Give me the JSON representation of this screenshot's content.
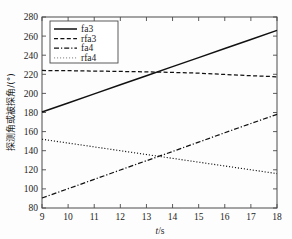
{
  "chart_data": {
    "type": "line",
    "title": "",
    "xlabel": "t/s",
    "ylabel": "探测角或被探角/(°)",
    "xlim": [
      9,
      18
    ],
    "ylim": [
      80,
      280
    ],
    "xticks": [
      9,
      10,
      11,
      12,
      13,
      14,
      15,
      16,
      17,
      18
    ],
    "yticks": [
      80,
      100,
      120,
      140,
      160,
      180,
      200,
      220,
      240,
      260,
      280
    ],
    "xtick_labels": [
      "9",
      "10",
      "11",
      "12",
      "13",
      "14",
      "15",
      "16",
      "17",
      "18"
    ],
    "ytick_labels": [
      "80",
      "100",
      "120",
      "140",
      "160",
      "180",
      "200",
      "220",
      "240",
      "260",
      "280"
    ],
    "grid": false,
    "legend_position": "upper-left",
    "x": [
      9,
      10,
      11,
      12,
      13,
      14,
      15,
      16,
      17,
      18
    ],
    "series": [
      {
        "name": "fa3",
        "style": "solid",
        "color": "#111111",
        "values": [
          180.5,
          190.0,
          199.5,
          209.0,
          218.5,
          228.0,
          237.5,
          247.0,
          256.5,
          266.0
        ]
      },
      {
        "name": "rfa3",
        "style": "dashed",
        "color": "#111111",
        "values": [
          224.0,
          223.8,
          223.4,
          223.0,
          222.6,
          222.0,
          221.2,
          219.8,
          218.5,
          217.4
        ]
      },
      {
        "name": "fa4",
        "style": "dashdot",
        "color": "#111111",
        "values": [
          90.5,
          100.2,
          110.0,
          119.8,
          129.5,
          139.2,
          149.0,
          158.8,
          168.5,
          178.0
        ]
      },
      {
        "name": "rfa4",
        "style": "dotted",
        "color": "#999999",
        "values": [
          152.0,
          148.0,
          144.0,
          140.0,
          136.0,
          132.0,
          128.0,
          124.0,
          120.0,
          116.0
        ]
      }
    ],
    "annotations": []
  },
  "legend": {
    "entries": [
      {
        "label": "fa3"
      },
      {
        "label": "rfa3"
      },
      {
        "label": "fa4"
      },
      {
        "label": "rfa4"
      }
    ]
  },
  "axes": {
    "x_axis_title": "t/s",
    "x_axis_title_italic": "t",
    "x_axis_title_rest": "/s",
    "y_axis_title": "探测角或被探角/(°)"
  }
}
